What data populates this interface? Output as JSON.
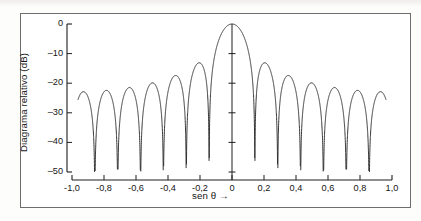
{
  "figure": {
    "background_color": "#ffffff",
    "border_color": "#6d6d6d",
    "curve_color": "#2b2b2b",
    "axis_color": "#1e1e1e"
  },
  "chart_data": {
    "type": "line",
    "title": "",
    "subtitle": "",
    "xlabel": "sen θ →",
    "ylabel": "Diagrama relativo (dB)",
    "xlim": [
      -1.0,
      1.0
    ],
    "ylim": [
      -50,
      0
    ],
    "grid": false,
    "legend": null,
    "xticks": [
      -1.0,
      -0.8,
      -0.6,
      -0.4,
      -0.2,
      0,
      0.2,
      0.4,
      0.6,
      0.8,
      1.0
    ],
    "xticklabels": [
      "-1,0",
      "-0,8",
      "-0,6",
      "-0,4",
      "-0,2",
      "0",
      "0,2",
      "0,4",
      "0,6",
      "0,8",
      "1,0"
    ],
    "yticks": [
      0,
      -10,
      -20,
      -30,
      -40,
      -50
    ],
    "yticklabels": [
      "0",
      "–10",
      "–20",
      "–30",
      "–40",
      "–50"
    ],
    "center_axis_ticks": [
      -10,
      -20,
      -30,
      -40,
      -50
    ],
    "series": [
      {
        "name": "Diagrama relativo",
        "model": "array_factor",
        "elements": 14,
        "spacing_lambda": 0.5,
        "floor_db": -50,
        "peak_db": 0,
        "main_lobe": {
          "x": 0.0,
          "y": 0.0
        },
        "nulls_x": [
          -0.9643,
          -0.8929,
          -0.8214,
          -0.75,
          -0.6786,
          -0.6071,
          -0.5357,
          -0.4643,
          -0.3929,
          -0.3214,
          -0.25,
          -0.1786,
          -0.1071,
          0.1071,
          0.1786,
          0.25,
          0.3214,
          0.3929,
          0.4643,
          0.5357,
          0.6071,
          0.6786,
          0.75,
          0.8214,
          0.8929,
          0.9643
        ],
        "sidelobe_peaks": [
          {
            "x": -0.929,
            "y": -41.0
          },
          {
            "x": -0.857,
            "y": -40.0
          },
          {
            "x": -0.786,
            "y": -38.6
          },
          {
            "x": -0.714,
            "y": -37.0
          },
          {
            "x": -0.643,
            "y": -35.2
          },
          {
            "x": -0.571,
            "y": -33.2
          },
          {
            "x": -0.5,
            "y": -31.1
          },
          {
            "x": -0.429,
            "y": -29.0
          },
          {
            "x": -0.357,
            "y": -26.5
          },
          {
            "x": -0.286,
            "y": -23.6
          },
          {
            "x": -0.214,
            "y": -20.0
          },
          {
            "x": -0.143,
            "y": -16.8
          },
          {
            "x": 0.143,
            "y": -16.8
          },
          {
            "x": 0.214,
            "y": -20.0
          },
          {
            "x": 0.286,
            "y": -23.6
          },
          {
            "x": 0.357,
            "y": -26.5
          },
          {
            "x": 0.429,
            "y": -29.0
          },
          {
            "x": 0.5,
            "y": -31.1
          },
          {
            "x": 0.571,
            "y": -33.2
          },
          {
            "x": 0.643,
            "y": -35.2
          },
          {
            "x": 0.714,
            "y": -37.0
          },
          {
            "x": 0.786,
            "y": -38.6
          },
          {
            "x": 0.857,
            "y": -40.0
          },
          {
            "x": 0.929,
            "y": -41.0
          }
        ],
        "x_start": -0.962,
        "x_end": 0.962
      }
    ]
  }
}
